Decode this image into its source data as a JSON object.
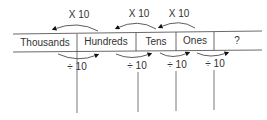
{
  "columns": [
    {
      "label": "Thousands"
    },
    {
      "label": "Hundreds"
    },
    {
      "label": "Tens"
    },
    {
      "label": "Ones"
    },
    {
      "label": "?"
    }
  ],
  "multiply_arrows": [
    {
      "label": "X 10",
      "from": "Hundreds",
      "to": "Thousands"
    },
    {
      "label": "X 10",
      "from": "Tens",
      "to": "Hundreds"
    },
    {
      "label": "X 10",
      "from": "Ones",
      "to": "Tens"
    }
  ],
  "divide_arrows": [
    {
      "label": "÷ 10",
      "from": "Thousands",
      "to": "Hundreds"
    },
    {
      "label": "÷ 10",
      "from": "Hundreds",
      "to": "Tens"
    },
    {
      "label": "÷ 10",
      "from": "Tens",
      "to": "Ones"
    },
    {
      "label": "÷ 10",
      "from": "Ones",
      "to": "?"
    }
  ]
}
